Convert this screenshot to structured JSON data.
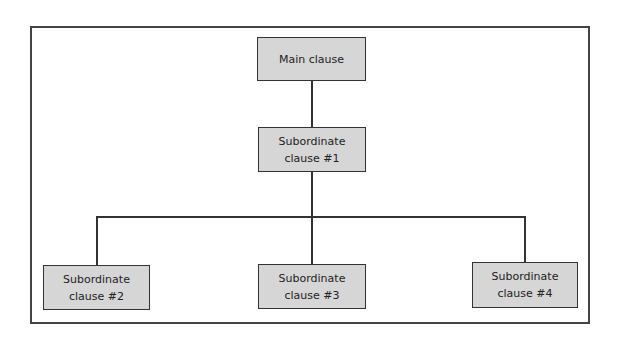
{
  "diagram": {
    "nodes": [
      {
        "id": "main",
        "label": "Main clause"
      },
      {
        "id": "sub1",
        "label": "Subordinate clause #1"
      },
      {
        "id": "sub2",
        "label": "Subordinate clause #2"
      },
      {
        "id": "sub3",
        "label": "Subordinate clause #3"
      },
      {
        "id": "sub4",
        "label": "Subordinate clause #4"
      }
    ],
    "edges": [
      [
        "main",
        "sub1"
      ],
      [
        "sub1",
        "sub2"
      ],
      [
        "sub1",
        "sub3"
      ],
      [
        "sub1",
        "sub4"
      ]
    ],
    "colors": {
      "box_fill": "#d6d6d6",
      "border": "#333333"
    }
  }
}
